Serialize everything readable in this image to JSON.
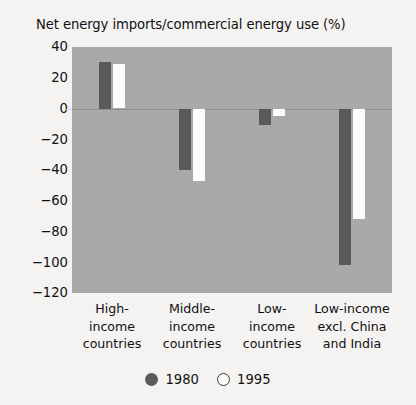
{
  "chart_data": {
    "type": "bar",
    "title": "Net energy imports/commercial energy use (%)",
    "xlabel": "",
    "ylabel": "",
    "ylim": [
      -120,
      40
    ],
    "yticks": [
      40,
      20,
      0,
      -20,
      -40,
      -60,
      -80,
      -100,
      -120
    ],
    "ytick_labels": [
      "40",
      "20",
      "0",
      "−20",
      "−40",
      "−60",
      "−80",
      "−100",
      "−120"
    ],
    "grid": false,
    "zero_line": true,
    "legend_position": "bottom",
    "categories": [
      "High-\nincome\ncountries",
      "Middle-\nincome\ncountries",
      "Low-\nincome\ncountries",
      "Low-income\nexcl. China\nand India"
    ],
    "category_lines": [
      [
        "High-",
        "income",
        "countries"
      ],
      [
        "Middle-",
        "income",
        "countries"
      ],
      [
        "Low-",
        "income",
        "countries"
      ],
      [
        "Low-income",
        "excl. China",
        "and India"
      ]
    ],
    "series": [
      {
        "name": "1980",
        "color": "#5a5a5a",
        "values": [
          30,
          -40,
          -11,
          -102
        ]
      },
      {
        "name": "1995",
        "color": "#fdfdfb",
        "values": [
          29,
          -47,
          -5,
          -72
        ]
      }
    ]
  },
  "legend": {
    "items": [
      {
        "label": "1980",
        "marker": "filled-circle-icon"
      },
      {
        "label": "1995",
        "marker": "open-circle-icon"
      }
    ]
  },
  "colors": {
    "plot_background": "#a9a9a9",
    "page_background": "#f4f3f1",
    "series_1980": "#5a5a5a",
    "series_1995": "#fdfdfb",
    "text": "#111111"
  }
}
